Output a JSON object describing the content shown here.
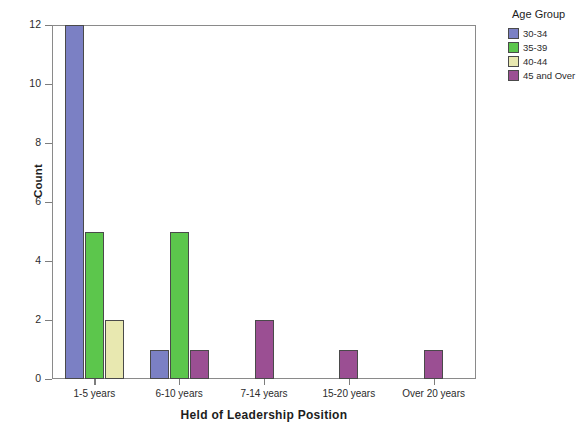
{
  "chart_data": {
    "type": "bar",
    "title": "",
    "xlabel": "Held of Leadership Position",
    "ylabel": "Count",
    "categories": [
      "1-5 years",
      "6-10 years",
      "7-14 years",
      "15-20 years",
      "Over 20 years"
    ],
    "series": [
      {
        "name": "30-34",
        "color": "#7b80c4",
        "values": [
          12,
          1,
          0,
          0,
          0
        ]
      },
      {
        "name": "35-39",
        "color": "#5cc64c",
        "values": [
          5,
          5,
          0,
          0,
          0
        ]
      },
      {
        "name": "40-44",
        "color": "#e8e8b0",
        "values": [
          2,
          0,
          0,
          0,
          0
        ]
      },
      {
        "name": "45 and Over",
        "color": "#9b4f93",
        "values": [
          0,
          1,
          2,
          1,
          1
        ]
      }
    ],
    "ylim": [
      0,
      12
    ],
    "yticks": [
      0,
      2,
      4,
      6,
      8,
      10,
      12
    ],
    "ytick_labels": [
      "0",
      "2",
      "4",
      "6",
      "8",
      "10",
      "12"
    ],
    "grid": false,
    "legend_position": "right",
    "legend_title": "Age Group"
  },
  "legend": {
    "title": "Age Group",
    "items": [
      {
        "label": "30-34"
      },
      {
        "label": "35-39"
      },
      {
        "label": "40-44"
      },
      {
        "label": "45 and Over"
      }
    ]
  },
  "axes": {
    "y_title": "Count",
    "x_title": "Held of Leadership Position"
  }
}
